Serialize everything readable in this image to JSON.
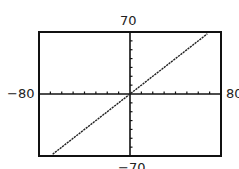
{
  "window": {
    "xmin_label": "−80",
    "xmax_label": "80",
    "ymax_label": "70",
    "ymin_label": "−70"
  },
  "chart_data": {
    "type": "line",
    "title": "",
    "xlabel": "",
    "ylabel": "",
    "xlim": [
      -80,
      80
    ],
    "ylim": [
      -70,
      70
    ],
    "xscl": 10,
    "yscl": 10,
    "grid": false,
    "legend": null,
    "series": [
      {
        "name": "y = x",
        "x": [
          -68,
          68
        ],
        "y": [
          -68,
          68
        ]
      }
    ],
    "tick_labels": {
      "x": [
        "−80",
        "80"
      ],
      "y": [
        "70",
        "−70"
      ]
    }
  },
  "colors": {
    "axis": "#111111",
    "line": "#222222",
    "frame": "#111111",
    "background": "#ffffff"
  }
}
